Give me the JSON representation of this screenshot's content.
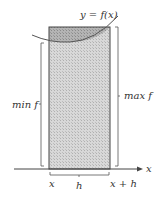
{
  "diagram": {
    "type": "riemann-rectangle-bounds",
    "curve_label": "y = f(x)",
    "x_axis_label": "x",
    "left_bracket_label": "min f",
    "right_bracket_label": "max f",
    "bottom_left_label": "x",
    "bottom_right_label": "x + h",
    "width_label": "h",
    "colors": {
      "light_fill": "#cfcfcf",
      "dark_fill": "#a8a8a8",
      "stroke": "#444444"
    }
  }
}
